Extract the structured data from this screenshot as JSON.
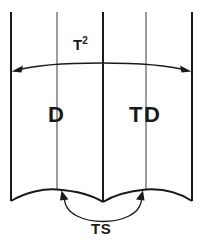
{
  "diagram": {
    "background_color": "#ffffff",
    "line_color": "#1a1a1a",
    "thin_line_color": "#3a3a3a",
    "width": 207,
    "height": 246,
    "labels": {
      "top_dimension": "T",
      "top_dimension_superscript": "2",
      "left_flank": "D",
      "right_flank": "TD",
      "bottom_dimension": "TS"
    },
    "geometry": {
      "vertical_lines_x": [
        11,
        57,
        103,
        146,
        192
      ],
      "thick_lines_x": [
        11,
        103,
        192
      ],
      "thin_lines_x": [
        57,
        146
      ],
      "top_y": 12,
      "bottom_edge_left_y": 200,
      "scallop_peak_y": 189,
      "scallop_valley_y": 201,
      "top_dimension_arc_y": 70,
      "ts_arc_bottom_y": 219
    }
  }
}
